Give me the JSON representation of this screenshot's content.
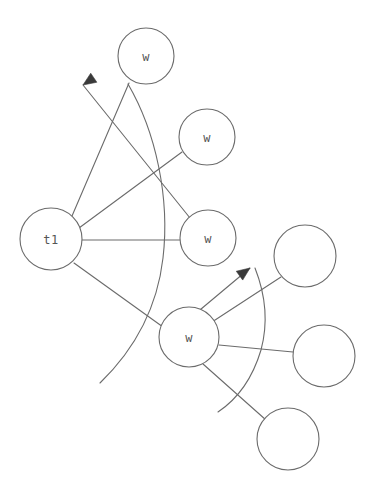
{
  "diagram": {
    "canvas": {
      "width": 376,
      "height": 491,
      "background": "#ffffff"
    },
    "style": {
      "stroke_color": "#6b6b6b",
      "node_fill": "#ffffff",
      "label_color": "#555555",
      "arrow_fill": "#3a3a3a",
      "stroke_width": 1.1
    },
    "nodes": [
      {
        "id": "t1",
        "label": "t1",
        "cx": 51,
        "cy": 239,
        "r": 31
      },
      {
        "id": "w1",
        "label": "w",
        "cx": 146,
        "cy": 56,
        "r": 28
      },
      {
        "id": "w2",
        "label": "w",
        "cx": 207,
        "cy": 137,
        "r": 28
      },
      {
        "id": "w3",
        "label": "w",
        "cx": 208,
        "cy": 238,
        "r": 28
      },
      {
        "id": "w4",
        "label": "w",
        "cx": 189,
        "cy": 337,
        "r": 30
      },
      {
        "id": "e1",
        "label": "",
        "cx": 305,
        "cy": 256,
        "r": 31
      },
      {
        "id": "e2",
        "label": "",
        "cx": 324,
        "cy": 356,
        "r": 31
      },
      {
        "id": "e3",
        "label": "",
        "cx": 288,
        "cy": 439,
        "r": 31
      }
    ],
    "edges": [
      {
        "id": "t1-w1",
        "from": "t1",
        "to": "w1",
        "x1": 72,
        "y1": 216,
        "x2": 129,
        "y2": 83
      },
      {
        "id": "t1-w2",
        "from": "t1",
        "to": "w2",
        "x1": 79,
        "y1": 228,
        "x2": 182,
        "y2": 152
      },
      {
        "id": "t1-w3",
        "from": "t1",
        "to": "w3",
        "x1": 82,
        "y1": 240,
        "x2": 180,
        "y2": 240
      },
      {
        "id": "t1-w4",
        "from": "t1",
        "to": "w4",
        "x1": 74,
        "y1": 263,
        "x2": 163,
        "y2": 327
      },
      {
        "id": "w4-e1",
        "from": "w4",
        "to": "e1",
        "x1": 212,
        "y1": 322,
        "x2": 281,
        "y2": 277
      },
      {
        "id": "w4-e2",
        "from": "w4",
        "to": "e2",
        "x1": 219,
        "y1": 345,
        "x2": 293,
        "y2": 352
      },
      {
        "id": "w4-e3",
        "from": "w4",
        "to": "e3",
        "x1": 203,
        "y1": 364,
        "x2": 266,
        "y2": 420
      }
    ],
    "arcs": [
      {
        "id": "arc-t1",
        "label": "sweep-arc-left",
        "path": "M 128 84 C 156 132 170 198 163 258 C 157 310 132 352 100 383",
        "arrow": {
          "id": "arrowhead-t1",
          "tip_x": 83,
          "tip_y": 85,
          "angle_deg": 214,
          "size": 13
        },
        "tail": {
          "x1": 190,
          "y1": 218,
          "x2": 83,
          "y2": 85
        }
      },
      {
        "id": "arc-w4",
        "label": "sweep-arc-right",
        "path": "M 255 268 C 266 296 268 324 261 350 C 252 380 236 400 218 412",
        "arrow": {
          "id": "arrowhead-w4",
          "tip_x": 250,
          "tip_y": 268,
          "angle_deg": 36,
          "size": 13
        },
        "tail": {
          "x1": 176,
          "y1": 330,
          "x2": 250,
          "y2": 268
        }
      }
    ]
  }
}
